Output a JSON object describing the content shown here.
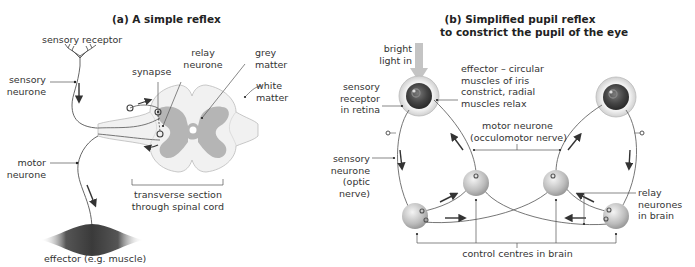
{
  "panel_a": {
    "title": "(a) A simple reflex",
    "labels": {
      "sensory_receptor": "sensory receptor",
      "sensory_neurone_1": "sensory",
      "sensory_neurone_2": "neurone",
      "synapse": "synapse",
      "relay_neurone_1": "relay",
      "relay_neurone_2": "neurone",
      "grey_matter_1": "grey",
      "grey_matter_2": "matter",
      "white_matter_1": "white",
      "white_matter_2": "matter",
      "motor_neurone_1": "motor",
      "motor_neurone_2": "neurone",
      "transverse_1": "transverse section",
      "transverse_2": "through spinal cord",
      "effector": "effector (e.g. muscle)"
    }
  },
  "panel_b": {
    "title_1": "(b) Simplified pupil reflex",
    "title_2": "to constrict the pupil of the eye",
    "labels": {
      "bright_light_1": "bright",
      "bright_light_2": "light in",
      "sensory_receptor_1": "sensory",
      "sensory_receptor_2": "receptor",
      "sensory_receptor_3": "in retina",
      "effector_1": "effector – circular",
      "effector_2": "muscles of iris",
      "effector_3": "constrict, radial",
      "effector_4": "muscles relax",
      "motor_neurone_1": "motor neurone",
      "motor_neurone_2": "(occulomotor nerve)",
      "sensory_neurone_1": "sensory",
      "sensory_neurone_2": "neurone",
      "sensory_neurone_3": "(optic",
      "sensory_neurone_4": "nerve)",
      "relay_1": "relay",
      "relay_2": "neurones",
      "relay_3": "in brain",
      "control_centres": "control centres in brain"
    }
  },
  "colors": {
    "grey_matter": "#b8b8b8",
    "white_matter": "#f1f1f1",
    "muscle": "#4a4a4a",
    "light_arrow": "#bdbdbd",
    "line": "#555555"
  }
}
